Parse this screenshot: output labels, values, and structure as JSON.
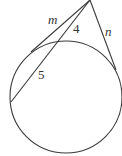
{
  "diagram": {
    "type": "geometry-circle-tangent-secant",
    "stroke_color": "#3a3a3a",
    "circle": {
      "cx": 66,
      "cy": 97,
      "r": 56
    },
    "external_point": {
      "x": 90,
      "y": 0
    },
    "tangent_m": {
      "from": [
        90,
        0
      ],
      "to": [
        31,
        52
      ],
      "label": "m"
    },
    "tangent_n": {
      "from": [
        90,
        0
      ],
      "to": [
        116,
        70
      ],
      "label": "n"
    },
    "secant": {
      "from": [
        90,
        0
      ],
      "entry": [
        58,
        40
      ],
      "exit": [
        11,
        102
      ]
    },
    "labels": {
      "m": "m",
      "n": "n",
      "external_segment": "4",
      "internal_segment": "5"
    }
  }
}
